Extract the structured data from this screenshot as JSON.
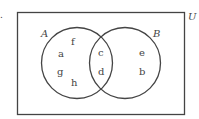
{
  "diagram": {
    "type": "venn",
    "universe_label": "U",
    "sets": [
      {
        "name": "A",
        "only": [
          "f",
          "a",
          "g",
          "h"
        ]
      },
      {
        "name": "B",
        "only": [
          "e",
          "b"
        ]
      }
    ],
    "intersection": [
      "c",
      "d"
    ],
    "stroke_color": "#444444",
    "margin_mark": "."
  },
  "labels": {
    "U": "U",
    "A": "A",
    "B": "B",
    "f": "f",
    "a": "a",
    "g": "g",
    "h": "h",
    "c": "c",
    "d": "d",
    "e": "e",
    "b": "b",
    "mark": "."
  }
}
